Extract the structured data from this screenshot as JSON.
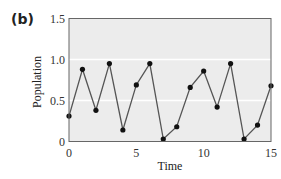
{
  "panel_label": "(b)",
  "chart_data": {
    "type": "line",
    "title": "",
    "xlabel": "Time",
    "ylabel": "Population",
    "xlim": [
      0,
      15
    ],
    "ylim": [
      0,
      1.5
    ],
    "xticks": [
      0,
      5,
      10,
      15
    ],
    "yticks": [
      0,
      0.5,
      1.0,
      1.5
    ],
    "ytick_labels": [
      "0",
      "0.5",
      "1.0",
      "1.5"
    ],
    "grid": "horizontal white lines at 0.5 and 1.0",
    "background_color": "#ececec",
    "line_color": "#555555",
    "marker_color": "#111111",
    "series": [
      {
        "name": "Population",
        "x": [
          0,
          1,
          2,
          3,
          4,
          5,
          6,
          7,
          8,
          9,
          10,
          11,
          12,
          13,
          14,
          15
        ],
        "values": [
          0.31,
          0.88,
          0.38,
          0.95,
          0.14,
          0.69,
          0.95,
          0.03,
          0.18,
          0.66,
          0.86,
          0.42,
          0.95,
          0.03,
          0.2,
          0.68
        ]
      }
    ]
  }
}
